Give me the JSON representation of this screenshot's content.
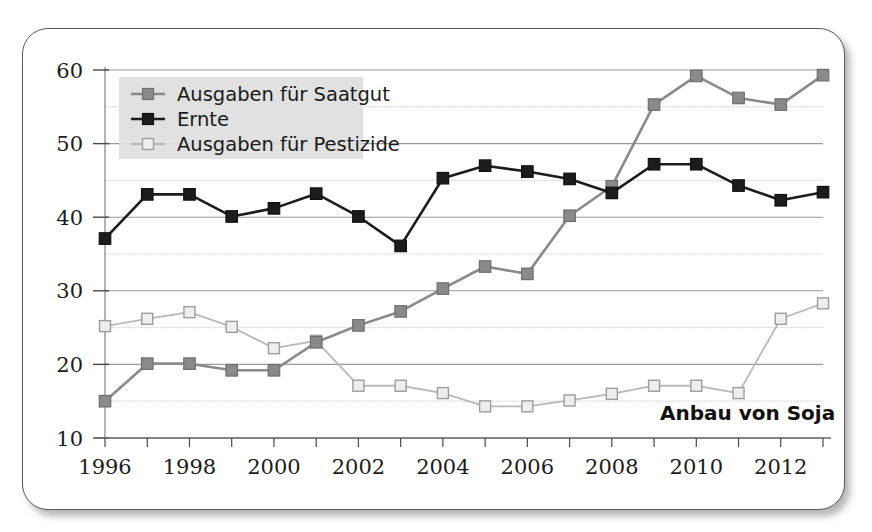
{
  "figure": {
    "annotation": "Anbau von Soja",
    "frame_color": "#5b5b5b",
    "background": "#ffffff"
  },
  "legend": {
    "position": "top-left",
    "background": "#dedede",
    "entries": [
      {
        "label": "Ausgaben für Saatgut",
        "color": "#8a8a8a",
        "marker": "filled-square"
      },
      {
        "label": "Ernte",
        "color": "#1c1c1c",
        "marker": "filled-square"
      },
      {
        "label": "Ausgaben für Pestizide",
        "color": "#b9b9b9",
        "marker": "open-square"
      }
    ]
  },
  "chart_data": {
    "type": "line",
    "title": "",
    "subtitle": "",
    "xlabel": "",
    "ylabel": "",
    "annotation": "Anbau von Soja",
    "grid": true,
    "grid_minor_step": 5,
    "legend_position": "top-left",
    "xlim": [
      1996,
      2013
    ],
    "ylim": [
      10,
      60
    ],
    "ytick_step": 10,
    "yticks": [
      10,
      20,
      30,
      40,
      50,
      60
    ],
    "ytick_labels": [
      "10",
      "20",
      "30",
      "40",
      "50",
      "60"
    ],
    "x": [
      1996,
      1997,
      1998,
      1999,
      2000,
      2001,
      2002,
      2003,
      2004,
      2005,
      2006,
      2007,
      2008,
      2009,
      2010,
      2011,
      2012,
      2013
    ],
    "xticks": [
      1996,
      1997,
      1998,
      1999,
      2000,
      2001,
      2002,
      2003,
      2004,
      2005,
      2006,
      2007,
      2008,
      2009,
      2010,
      2011,
      2012,
      2013
    ],
    "xtick_labels_shown": [
      "1996",
      "1998",
      "2000",
      "2002",
      "2004",
      "2006",
      "2008",
      "2010",
      "2012"
    ],
    "xtick_label_step": 2,
    "series": [
      {
        "name": "Ausgaben für Saatgut",
        "color": "#8a8a8a",
        "marker": "filled-square",
        "values": [
          15.0,
          20.1,
          20.1,
          19.2,
          19.2,
          23.0,
          25.3,
          27.2,
          30.3,
          33.3,
          32.3,
          40.2,
          44.2,
          55.3,
          59.2,
          56.2,
          55.3,
          59.3
        ]
      },
      {
        "name": "Ernte",
        "color": "#1c1c1c",
        "marker": "filled-square",
        "values": [
          37.1,
          43.1,
          43.1,
          40.1,
          41.2,
          43.2,
          40.1,
          36.1,
          45.3,
          47.0,
          46.2,
          45.2,
          43.3,
          47.2,
          47.2,
          44.3,
          42.3,
          43.4
        ]
      },
      {
        "name": "Ausgaben für Pestizide",
        "color": "#b9b9b9",
        "marker": "open-square",
        "values": [
          25.2,
          26.2,
          27.1,
          25.1,
          22.2,
          23.2,
          17.1,
          17.1,
          16.1,
          14.3,
          14.3,
          15.1,
          16.0,
          17.1,
          17.1,
          16.1,
          26.2,
          28.3
        ]
      }
    ]
  }
}
